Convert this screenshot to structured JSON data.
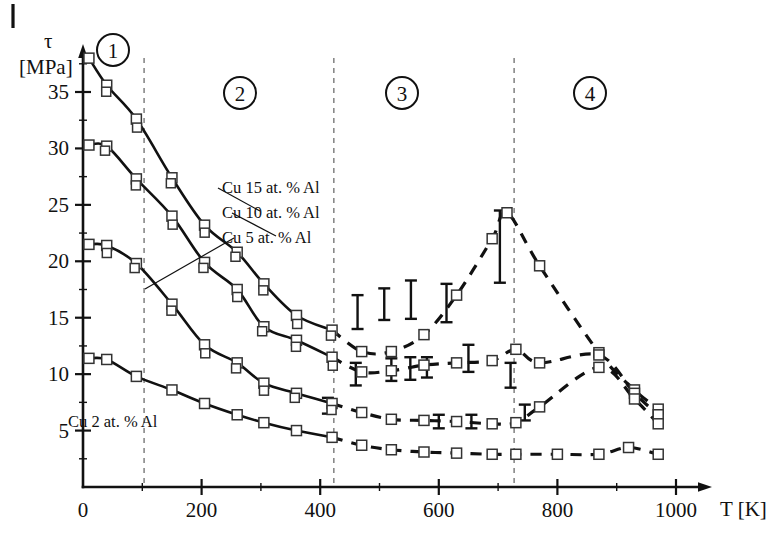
{
  "figure": {
    "corner_mark": "|",
    "y_axis": {
      "symbol": "τ",
      "unit": "[MPa]",
      "ticks": [
        5,
        10,
        15,
        20,
        25,
        30,
        35
      ]
    },
    "x_axis": {
      "label": "T [K]",
      "ticks": [
        0,
        200,
        400,
        600,
        800,
        1000
      ]
    },
    "regions": [
      {
        "id": "1",
        "label": "1"
      },
      {
        "id": "2",
        "label": "2"
      },
      {
        "id": "3",
        "label": "3"
      },
      {
        "id": "4",
        "label": "4"
      }
    ],
    "series_labels": [
      {
        "key": "cu15",
        "label": "Cu 15 at. % Al"
      },
      {
        "key": "cu10",
        "label": "Cu 10 at. % Al"
      },
      {
        "key": "cu5",
        "label": "Cu  5 at. % Al"
      },
      {
        "key": "cu2",
        "label": "Cu 2 at. % Al"
      }
    ],
    "colors": {
      "curve": "#111111",
      "marker_fill": "#ffffff",
      "marker_stroke": "#333333",
      "boundary": "#777777",
      "background": "#ffffff"
    }
  },
  "chart_data": {
    "type": "line",
    "title": "",
    "xlabel": "T [K]",
    "ylabel": "τ [MPa]",
    "xlim": [
      0,
      1020
    ],
    "ylim": [
      0,
      39
    ],
    "grid": false,
    "legend": "inline-leader-labels",
    "region_boundaries_K": [
      103,
      423,
      727
    ],
    "region_numbers": [
      "1",
      "2",
      "3",
      "4"
    ],
    "series": [
      {
        "name": "Cu 15 at. % Al",
        "style": "solid-then-dashed",
        "x": [
          10,
          40,
          90,
          150,
          205,
          260,
          305,
          360,
          420,
          470,
          520,
          575,
          630,
          690,
          715,
          770,
          870,
          930,
          970
        ],
        "y": [
          38.0,
          35.6,
          32.6,
          27.4,
          23.2,
          20.8,
          18.0,
          15.2,
          13.9,
          12.0,
          12.0,
          13.5,
          17.0,
          22.0,
          24.3,
          19.6,
          11.9,
          8.6,
          6.9
        ],
        "dashed_from_x": 420
      },
      {
        "name": "Cu 10 at. % Al",
        "style": "solid-then-dashed",
        "x": [
          10,
          40,
          90,
          150,
          205,
          260,
          305,
          360,
          420,
          470,
          520,
          575,
          630,
          690,
          730,
          770,
          870,
          930,
          970
        ],
        "y": [
          30.3,
          30.2,
          27.3,
          24.0,
          19.9,
          17.5,
          14.2,
          13.0,
          11.5,
          10.2,
          10.3,
          10.8,
          11.0,
          11.2,
          12.2,
          11.0,
          11.7,
          8.3,
          6.4
        ],
        "dashed_from_x": 420
      },
      {
        "name": "Cu  5 at. % Al",
        "style": "solid-then-dashed",
        "x": [
          10,
          40,
          90,
          150,
          205,
          260,
          305,
          360,
          420,
          470,
          520,
          575,
          630,
          690,
          730,
          770,
          870,
          930,
          970
        ],
        "y": [
          21.5,
          21.4,
          19.8,
          16.2,
          12.6,
          11.0,
          9.2,
          8.3,
          7.4,
          6.6,
          6.0,
          5.9,
          5.8,
          5.6,
          5.7,
          7.1,
          10.6,
          7.8,
          5.6
        ],
        "dashed_from_x": 420
      },
      {
        "name": "Cu 2 at. % Al",
        "style": "solid-then-dashed",
        "x": [
          10,
          40,
          90,
          150,
          205,
          260,
          305,
          360,
          420,
          470,
          520,
          575,
          630,
          690,
          730,
          800,
          870,
          920,
          970
        ],
        "y": [
          11.4,
          11.3,
          9.8,
          8.6,
          7.4,
          6.4,
          5.7,
          5.0,
          4.4,
          3.7,
          3.3,
          3.1,
          3.0,
          2.9,
          2.9,
          2.9,
          2.9,
          3.5,
          2.9
        ],
        "dashed_from_x": 420
      }
    ],
    "error_bars": [
      {
        "x": 463,
        "y": 15.5,
        "err": 1.5
      },
      {
        "x": 508,
        "y": 16.2,
        "err": 1.4
      },
      {
        "x": 553,
        "y": 16.6,
        "err": 1.7
      },
      {
        "x": 613,
        "y": 16.3,
        "err": 1.7
      },
      {
        "x": 703,
        "y": 21.3,
        "err": 3.2
      },
      {
        "x": 460,
        "y": 10.0,
        "err": 1.0
      },
      {
        "x": 520,
        "y": 10.4,
        "err": 1.0
      },
      {
        "x": 552,
        "y": 10.5,
        "err": 1.0
      },
      {
        "x": 580,
        "y": 10.6,
        "err": 0.9
      },
      {
        "x": 650,
        "y": 11.4,
        "err": 1.2
      },
      {
        "x": 721,
        "y": 9.9,
        "err": 1.1
      },
      {
        "x": 413,
        "y": 7.2,
        "err": 0.7
      },
      {
        "x": 600,
        "y": 5.8,
        "err": 0.6
      },
      {
        "x": 655,
        "y": 5.8,
        "err": 0.6
      },
      {
        "x": 745,
        "y": 6.6,
        "err": 0.7
      }
    ]
  }
}
